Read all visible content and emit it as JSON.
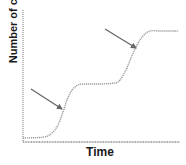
{
  "chart_data": {
    "type": "line",
    "title": "",
    "xlabel": "Time",
    "ylabel": "Number of cells",
    "grid": false,
    "legend": null,
    "x_ticks": [],
    "y_ticks": [],
    "series": [
      {
        "name": "growth curve (diauxic)",
        "style": "dotted",
        "color": "#999999",
        "points_px": [
          [
            23,
            138
          ],
          [
            44,
            137
          ],
          [
            52,
            133
          ],
          [
            58,
            125
          ],
          [
            63,
            112
          ],
          [
            67,
            100
          ],
          [
            72,
            90
          ],
          [
            78,
            85
          ],
          [
            84,
            84
          ],
          [
            100,
            84
          ],
          [
            115,
            83
          ],
          [
            120,
            80
          ],
          [
            126,
            70
          ],
          [
            131,
            58
          ],
          [
            137,
            45
          ],
          [
            143,
            36
          ],
          [
            150,
            31
          ],
          [
            160,
            31
          ],
          [
            178,
            31
          ]
        ]
      }
    ],
    "annotations": [
      {
        "type": "arrow",
        "from": [
          31,
          89
        ],
        "to": [
          62,
          109
        ],
        "label": "",
        "points_to": "first exponential phase"
      },
      {
        "type": "arrow",
        "from": [
          105,
          29
        ],
        "to": [
          136,
          48
        ],
        "label": "",
        "points_to": "second exponential phase"
      }
    ],
    "axes": {
      "x_axis": {
        "y": 142,
        "x_start": 23,
        "x_end": 180
      },
      "y_axis": {
        "x": 23,
        "y_start": 10,
        "y_end": 142
      }
    }
  },
  "labels": {
    "x_axis": "Time",
    "y_axis": "Number of cells"
  },
  "colors": {
    "axis": "#555555",
    "curve": "#9a9a9a",
    "arrow": "#666666",
    "text": "#1a1a1a"
  }
}
